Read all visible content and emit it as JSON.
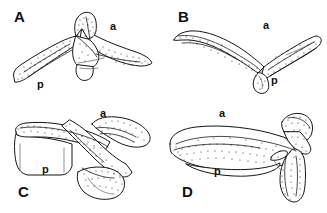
{
  "figure": {
    "caption_visible": false,
    "background_color": "#ffffff",
    "ink_color": "#141414",
    "panel_count": 4
  },
  "panels": [
    {
      "letter": "A",
      "name": "panel-a",
      "labels": {
        "anterior": "a",
        "posterior": "p"
      },
      "description": "V-shaped bifurcate bone in lateral view, stippled dorsal margin, anterior arm to the right, posterior arm to the left"
    },
    {
      "letter": "B",
      "name": "panel-b",
      "labels": {
        "anterior": "a",
        "posterior": "p"
      },
      "description": "Broad V-shaped bone with elongate slender arms, stippled surfaces, small ventral process at the apex"
    },
    {
      "letter": "C",
      "name": "panel-c",
      "labels": {
        "anterior": "a",
        "posterior": "p"
      },
      "description": "Stout bone in oblique view with heavily stippled ridges forming a cross-shaped pattern"
    },
    {
      "letter": "D",
      "name": "panel-d",
      "labels": {
        "anterior": "a",
        "posterior": "p"
      },
      "description": "Elongate blade-like bone with stippled dorsal surface and a descending stippled posterior process at the right"
    }
  ],
  "legend": {
    "anterior_abbrev": "a",
    "posterior_abbrev": "p"
  }
}
